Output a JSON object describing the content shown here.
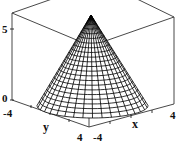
{
  "chart_data": {
    "type": "surface3d",
    "title": "",
    "surface": "cone",
    "xlabel": "x",
    "ylabel": "y",
    "zlabel": "",
    "xlim": [
      -4,
      4
    ],
    "ylim": [
      -4,
      4
    ],
    "zlim": [
      0,
      6
    ],
    "x_ticks": [
      "-4",
      "4"
    ],
    "y_ticks": [
      "-4",
      "4"
    ],
    "z_ticks": [
      "0",
      "5"
    ],
    "apex": {
      "x": 0,
      "y": 0,
      "z": 6
    },
    "base_radius": 4,
    "rings": 22,
    "radial_lines": 36,
    "box": true,
    "grid": false,
    "colors": {
      "mesh": "#000000",
      "box": "#333333",
      "background": "#ffffff"
    }
  },
  "labels": {
    "z_tick_5": "5",
    "z_tick_0": "0",
    "y_tick_min": "-4",
    "y_tick_max": "4",
    "x_tick_min": "-4",
    "x_tick_max": "4",
    "x_axis": "x",
    "y_axis": "y"
  }
}
